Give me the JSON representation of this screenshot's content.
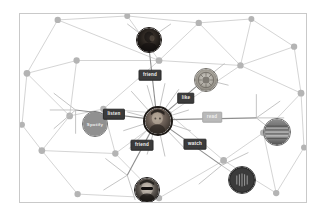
{
  "canvas": {
    "title": "Ego network graph",
    "background_color": "#ffffff",
    "border_color": "#c9c9c9",
    "edge_color": "#cfcfcf",
    "background_node_color": "#b4b4b4",
    "highlight_edge_color": "#8e8e8e"
  },
  "graph": {
    "ego_node": {
      "name": "ego-user-avatar",
      "type": "person-photo",
      "label": "",
      "x": 157,
      "y": 120,
      "r": 15
    },
    "nodes": [
      {
        "name": "friend-top-avatar",
        "type": "person-photo",
        "label": "",
        "tone": "dark",
        "x": 148,
        "y": 39,
        "r": 13
      },
      {
        "name": "like-badge-node",
        "type": "badge-logo",
        "label": "",
        "tone": "mid",
        "x": 205,
        "y": 79,
        "r": 12
      },
      {
        "name": "spotify-service-node",
        "type": "service-logo",
        "label": "Spotify",
        "tone": "mid",
        "x": 75,
        "y": 110,
        "r": 13
      },
      {
        "name": "article-image-node",
        "type": "article-photo",
        "label": "",
        "tone": "mid",
        "x": 257,
        "y": 118,
        "r": 14
      },
      {
        "name": "video-thumbnail-node",
        "type": "video-thumb",
        "label": "",
        "tone": "dark",
        "x": 222,
        "y": 166,
        "r": 14
      },
      {
        "name": "friend-bottom-avatar",
        "type": "person-photo",
        "label": "",
        "tone": "dark",
        "x": 127,
        "y": 176,
        "r": 13
      }
    ],
    "edges": [
      {
        "name": "edge-friend-top",
        "label": "friend",
        "from": "ego-user-avatar",
        "to": "friend-top-avatar",
        "label_x": 149,
        "label_y": 74,
        "state": "active"
      },
      {
        "name": "edge-like",
        "label": "like",
        "from": "ego-user-avatar",
        "to": "like-badge-node",
        "label_x": 185,
        "label_y": 97,
        "state": "active"
      },
      {
        "name": "edge-listen",
        "label": "listen",
        "from": "ego-user-avatar",
        "to": "spotify-service-node",
        "label_x": 113,
        "label_y": 113,
        "state": "active"
      },
      {
        "name": "edge-read",
        "label": "read",
        "from": "ego-user-avatar",
        "to": "article-image-node",
        "label_x": 211,
        "label_y": 116,
        "state": "muted"
      },
      {
        "name": "edge-watch",
        "label": "watch",
        "from": "ego-user-avatar",
        "to": "video-thumbnail-node",
        "label_x": 194,
        "label_y": 143,
        "state": "active"
      },
      {
        "name": "edge-friend-bottom",
        "label": "friend",
        "from": "ego-user-avatar",
        "to": "friend-bottom-avatar",
        "label_x": 141,
        "label_y": 144,
        "state": "active"
      }
    ]
  }
}
